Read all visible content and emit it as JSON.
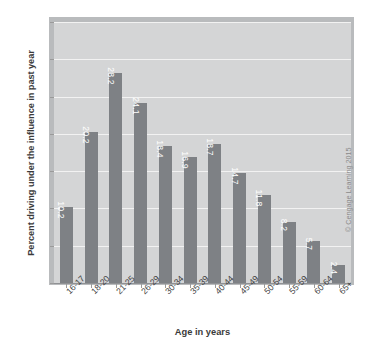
{
  "chart_data": {
    "type": "bar",
    "title": "",
    "xlabel": "Age in years",
    "ylabel": "Percent driving under the influence in past year",
    "categories": [
      "16-17",
      "18-20",
      "21-25",
      "26-29",
      "30-34",
      "35-39",
      "40-44",
      "45-49",
      "50-54",
      "55-59",
      "60-64",
      "65+"
    ],
    "values": [
      10.2,
      20.2,
      28.2,
      24.1,
      18.4,
      16.9,
      18.7,
      14.7,
      11.8,
      8.2,
      5.7,
      2.4
    ],
    "value_labels": [
      "10.2",
      "20.2",
      "28.2",
      "24.1",
      "18.4",
      "16.9",
      "18.7",
      "14.7",
      "11.8",
      "8.2",
      "5.7",
      "2.4"
    ],
    "ylim": [
      0,
      35
    ],
    "yticks": [
      0,
      5,
      10,
      15,
      20,
      25,
      30,
      35
    ],
    "ytick_labels": [
      "0",
      "5",
      "10",
      "15",
      "20",
      "25",
      "30",
      "35"
    ],
    "grid": true,
    "legend": null,
    "legend_position": "none",
    "colors": {
      "bar": "#7e8185",
      "plot_background": "#d4d5d6",
      "frame": "#b9bbbd",
      "gridline": "#f2f2f2",
      "value_label": "#ffffff",
      "axis_text": "#3f3f3f",
      "title_text": "#3b3b3b"
    }
  },
  "credit": {
    "text": "© Cengage Learning 2015"
  }
}
